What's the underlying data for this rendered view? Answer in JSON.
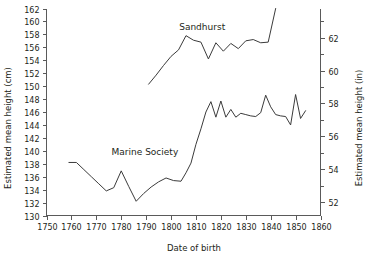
{
  "chart_data": {
    "type": "line",
    "title": "",
    "xlabel": "Date of birth",
    "ylabel": "Estimated mean height (cm)",
    "ylabel_right": "Estimated mean height (in)",
    "xlim": [
      1750,
      1860
    ],
    "ylim": [
      130,
      162
    ],
    "ylim_right": [
      51.18,
      63.78
    ],
    "xticks": [
      1750,
      1760,
      1770,
      1780,
      1790,
      1800,
      1810,
      1820,
      1830,
      1840,
      1850,
      1860
    ],
    "xtick_labels": [
      "1750",
      "1760",
      "1770",
      "1780",
      "1790",
      "1800",
      "1810",
      "1820",
      "1830",
      "1840",
      "1850",
      "1860"
    ],
    "yticks": [
      130,
      132,
      134,
      136,
      138,
      140,
      142,
      144,
      146,
      148,
      150,
      152,
      154,
      156,
      158,
      160,
      162
    ],
    "ytick_labels": [
      "130",
      "132",
      "134",
      "136",
      "138",
      "140",
      "142",
      "144",
      "146",
      "148",
      "150",
      "152",
      "154",
      "156",
      "158",
      "160",
      "162"
    ],
    "yticks_right": [
      52,
      54,
      56,
      58,
      60,
      62
    ],
    "ytick_labels_right": [
      "52",
      "54",
      "56",
      "58",
      "60",
      "62"
    ],
    "yticks_right_minor": [
      53,
      55,
      57,
      59,
      61,
      63
    ],
    "grid": false,
    "legend": "inline-annotation",
    "line_color": "#3b3b3b",
    "axis_color": "#5a5a5a",
    "series": [
      {
        "name": "Marine Society",
        "annotation": "Marine Society",
        "annotation_x": 1789.5,
        "annotation_y": 139.4,
        "x": [
          1759,
          1762,
          1765,
          1768,
          1771,
          1774,
          1777,
          1780,
          1783,
          1786,
          1789,
          1792,
          1795,
          1798,
          1801,
          1804,
          1806,
          1808,
          1810,
          1812,
          1814,
          1816,
          1818,
          1820,
          1822,
          1824,
          1826,
          1828,
          1830,
          1832,
          1834,
          1836,
          1838,
          1840,
          1842,
          1844,
          1846,
          1848,
          1850,
          1852,
          1854
        ],
        "y": [
          138.2,
          138.2,
          137.1,
          136.0,
          134.9,
          133.8,
          134.3,
          136.9,
          134.5,
          132.2,
          133.4,
          134.4,
          135.2,
          135.8,
          135.4,
          135.3,
          136.6,
          138.1,
          141.0,
          143.4,
          146.0,
          147.6,
          145.2,
          147.7,
          145.2,
          146.4,
          145.2,
          145.8,
          145.6,
          145.4,
          145.3,
          145.9,
          148.6,
          146.8,
          145.6,
          145.4,
          145.3,
          144.0,
          148.7,
          145.0,
          146.2
        ]
      },
      {
        "name": "Sandhurst",
        "annotation": "Sandhurst",
        "annotation_x": 1812.5,
        "annotation_y": 158.6,
        "x": [
          1791,
          1794,
          1797,
          1800,
          1803,
          1806,
          1809,
          1812,
          1815,
          1818,
          1821,
          1824,
          1827,
          1830,
          1833,
          1836,
          1839,
          1842
        ],
        "y": [
          150.3,
          151.7,
          153.2,
          154.6,
          155.6,
          157.8,
          157.1,
          156.8,
          154.2,
          156.7,
          155.4,
          156.6,
          155.8,
          157.0,
          157.2,
          156.7,
          156.8,
          162.0
        ]
      }
    ]
  },
  "axis_titles": {
    "left": "Estimated mean height (cm)",
    "right": "Estimated mean height (in)",
    "bottom": "Date of birth"
  }
}
